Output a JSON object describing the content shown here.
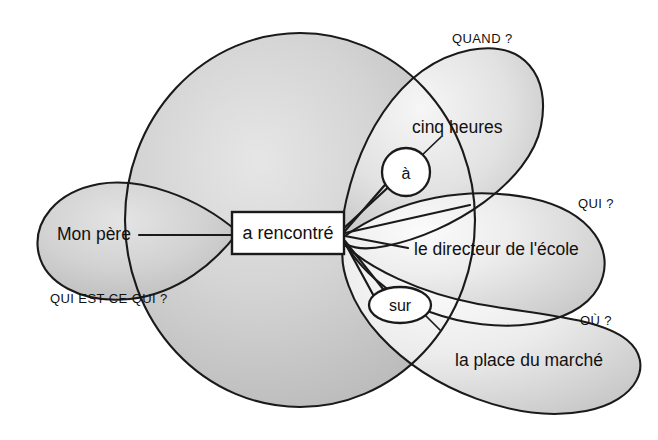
{
  "diagram": {
    "type": "valency-diagram",
    "language": "fr",
    "background_color": "#ffffff",
    "lobe_fill_color": "#cccccc",
    "lobe_fill_light": "#f2f2f2",
    "outline_color": "#1a1a1a",
    "text_color": "#111111"
  },
  "core": {
    "verb": "a rencontré",
    "verb_box_color": "#ffffff"
  },
  "prepositions": [
    {
      "id": "a-accent",
      "label": "à",
      "shape": "circle"
    },
    {
      "id": "sur",
      "label": "sur",
      "shape": "ellipse"
    }
  ],
  "arguments": [
    {
      "id": "subject",
      "phrase": "Mon père",
      "question": "QUI EST-CE QUI ?",
      "position": "left"
    },
    {
      "id": "time",
      "phrase": "cinq heures",
      "question": "QUAND ?",
      "preposition": "à",
      "position": "upper-right"
    },
    {
      "id": "object",
      "phrase": "le directeur de l'école",
      "question": "QUI ?",
      "position": "right"
    },
    {
      "id": "place",
      "phrase": "la place du marché",
      "question": "OÙ ?",
      "preposition": "sur",
      "position": "lower-right"
    }
  ],
  "labels": {
    "quand": "QUAND ?",
    "qui": "QUI ?",
    "ou": "OÙ ?",
    "qui_est_ce_qui": "QUI EST-CE QUI ?",
    "cinq_heures": "cinq heures",
    "mon_pere": "Mon père",
    "le_directeur": "le directeur de l'école",
    "la_place": "la place du marché",
    "a_rencontre": "a rencontré",
    "prep_a": "à",
    "prep_sur": "sur"
  }
}
